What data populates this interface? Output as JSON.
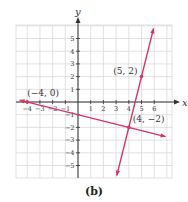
{
  "chart_data": {
    "type": "line",
    "title": "",
    "caption": "(b)",
    "xlabel": "x",
    "ylabel": "y",
    "xlim": [
      -4.6,
      6.9
    ],
    "ylim": [
      -6,
      6
    ],
    "x_ticks": [
      -4,
      -3,
      -2,
      -1,
      1,
      2,
      3,
      4,
      5,
      6
    ],
    "y_ticks": [
      5,
      4,
      3,
      2,
      1,
      -1,
      -2,
      -3,
      -4,
      -5
    ],
    "grid": true,
    "legend": null,
    "series": [
      {
        "name": "line-1",
        "equation": "y = -x/4 - 1",
        "color": "#d6336c",
        "x": [
          -4.6,
          -4,
          4,
          6.9
        ],
        "y": [
          0.15,
          0,
          -2,
          -2.725
        ]
      },
      {
        "name": "line-2",
        "equation": "y = 4x - 18",
        "color": "#d6336c",
        "x": [
          3.05,
          4,
          5,
          5.95
        ],
        "y": [
          -5.8,
          -2,
          2,
          5.8
        ]
      }
    ],
    "points": [
      {
        "x": -4,
        "y": 0,
        "label": "(−4, 0)"
      },
      {
        "x": 5,
        "y": 2,
        "label": "(5, 2)"
      },
      {
        "x": 4,
        "y": -2,
        "label": "(4, −2)"
      }
    ]
  },
  "layout": {
    "origin_px": [
      78,
      102
    ],
    "unit_px": 12.7,
    "grid_left_px": 16,
    "grid_right_px": 172,
    "grid_top_px": 25,
    "grid_bottom_px": 178,
    "colors": {
      "grid": "#d9d9d9",
      "axis": "#333333",
      "line": "#d6336c",
      "text": "#333333"
    }
  }
}
